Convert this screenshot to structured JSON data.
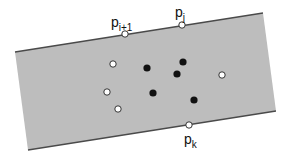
{
  "diagram": {
    "type": "point-set-in-strip",
    "colors": {
      "background": "#ffffff",
      "strip_fill": "#bdbdbd",
      "strip_edge": "#4a4a4a",
      "open_point_fill": "#ffffff",
      "open_point_stroke": "#333333",
      "filled_point": "#111111"
    },
    "strip": {
      "top_line": {
        "x1": 15,
        "y1": 52,
        "x2": 263,
        "y2": 13
      },
      "bottom_line": {
        "x1": 28,
        "y1": 150,
        "x2": 276,
        "y2": 111
      }
    },
    "labeled_points": [
      {
        "id": "p_i+1",
        "base": "p",
        "subscript": "i+1",
        "x": 125,
        "y": 34,
        "style": "open",
        "label_x": 111,
        "label_y": 27
      },
      {
        "id": "p_j",
        "base": "p",
        "subscript": "j",
        "x": 182,
        "y": 25,
        "style": "open",
        "label_x": 175,
        "label_y": 17
      },
      {
        "id": "p_k",
        "base": "p",
        "subscript": "k",
        "x": 189,
        "y": 125,
        "style": "open",
        "label_x": 184,
        "label_y": 144
      }
    ],
    "open_points": [
      {
        "x": 113,
        "y": 64
      },
      {
        "x": 222,
        "y": 75
      },
      {
        "x": 107,
        "y": 92
      },
      {
        "x": 118,
        "y": 109
      }
    ],
    "filled_points": [
      {
        "x": 147,
        "y": 68
      },
      {
        "x": 183,
        "y": 62
      },
      {
        "x": 177,
        "y": 74
      },
      {
        "x": 153,
        "y": 93
      },
      {
        "x": 194,
        "y": 100
      }
    ]
  }
}
